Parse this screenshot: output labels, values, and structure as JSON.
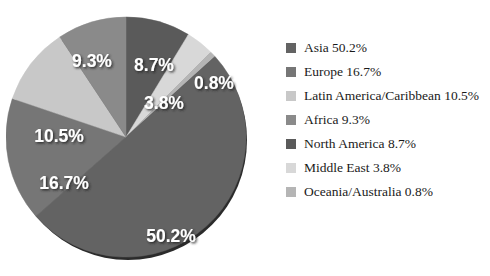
{
  "chart_data": {
    "type": "pie",
    "title": "",
    "categories": [
      "Asia",
      "Europe",
      "Latin America/Caribbean",
      "Africa",
      "North America",
      "Middle East",
      "Oceania/Australia"
    ],
    "values": [
      50.2,
      16.7,
      10.5,
      9.3,
      8.7,
      3.8,
      0.8
    ],
    "unit": "%",
    "data_labels": [
      "50.2%",
      "16.7%",
      "10.5%",
      "9.3%",
      "8.7%",
      "3.8%",
      "0.8%"
    ],
    "legend_position": "right",
    "grid": false,
    "slice_order_clockwise_from_top": [
      "North America",
      "Middle East",
      "Oceania/Australia",
      "Asia",
      "Europe",
      "Latin America/Caribbean",
      "Africa"
    ],
    "colors": {
      "Asia": "#636363",
      "Europe": "#767676",
      "Latin America/Caribbean": "#c8c8c8",
      "Africa": "#8a8a8a",
      "North America": "#5a5a5a",
      "Middle East": "#d8d8d8",
      "Oceania/Australia": "#b5b5b5"
    },
    "label_color": "#ffffff",
    "shadow_color": "#2b2b2b",
    "background": "#ffffff"
  },
  "pie": {
    "slices": [
      {
        "name": "North America",
        "label": "8.7%",
        "value": 8.7,
        "color": "#5a5a5a",
        "label_x": 148,
        "label_y": 57
      },
      {
        "name": "Middle East",
        "label": "3.8%",
        "value": 3.8,
        "color": "#d8d8d8",
        "label_x": 158,
        "label_y": 95
      },
      {
        "name": "Oceania/Australia",
        "label": "0.8%",
        "value": 0.8,
        "color": "#b5b5b5",
        "label_x": 208,
        "label_y": 75
      },
      {
        "name": "Asia",
        "label": "50.2%",
        "value": 50.2,
        "color": "#636363",
        "label_x": 165,
        "label_y": 228
      },
      {
        "name": "Europe",
        "label": "16.7%",
        "value": 16.7,
        "color": "#767676",
        "label_x": 58,
        "label_y": 175
      },
      {
        "name": "Latin America/Caribbean",
        "label": "10.5%",
        "value": 10.5,
        "color": "#c8c8c8",
        "label_x": 53,
        "label_y": 128
      },
      {
        "name": "Africa",
        "label": "9.3%",
        "value": 9.3,
        "color": "#8a8a8a",
        "label_x": 86,
        "label_y": 53
      }
    ]
  },
  "legend": {
    "items": [
      {
        "label": "Asia 50.2%",
        "color": "#636363"
      },
      {
        "label": "Europe 16.7%",
        "color": "#767676"
      },
      {
        "label": "Latin America/Caribbean 10.5%",
        "color": "#c8c8c8"
      },
      {
        "label": "Africa 9.3%",
        "color": "#8a8a8a"
      },
      {
        "label": "North America 8.7%",
        "color": "#5a5a5a"
      },
      {
        "label": "Middle East 3.8%",
        "color": "#d8d8d8"
      },
      {
        "label": "Oceania/Australia 0.8%",
        "color": "#b5b5b5"
      }
    ]
  }
}
